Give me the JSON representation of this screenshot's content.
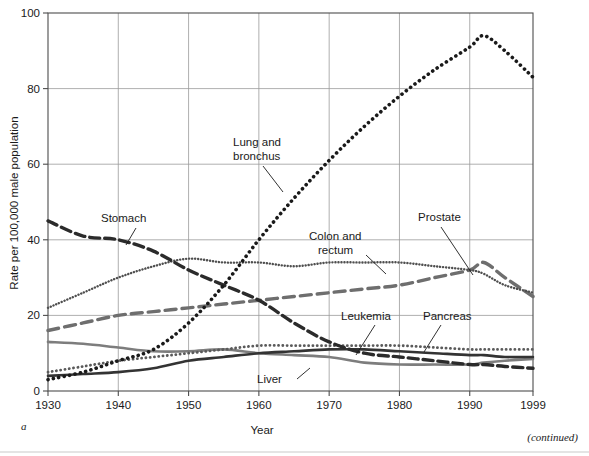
{
  "figure": {
    "panel_letter": "a",
    "continued_note": "(continued)"
  },
  "axes": {
    "ylabel": "Rate per 100,000 male population",
    "xlabel": "Year",
    "y_ticks": [
      "0",
      "20",
      "40",
      "60",
      "80",
      "100"
    ],
    "x_ticks": [
      "1930",
      "1940",
      "1950",
      "1960",
      "1970",
      "1980",
      "1990",
      "1999"
    ]
  },
  "labels": {
    "lung": "Lung and\nbronchus",
    "lung_line1": "Lung and",
    "lung_line2": "bronchus",
    "stomach": "Stomach",
    "colon_line1": "Colon and",
    "colon_line2": "rectum",
    "prostate": "Prostate",
    "leukemia": "Leukemia",
    "pancreas": "Pancreas",
    "liver": "Liver"
  },
  "colors": {
    "stomach": "#2b2b2b",
    "lung": "#1a1a1a",
    "colon": "#4f4f4f",
    "prostate": "#6e6e6e",
    "pancreas": "#5a5a5a",
    "leukemia": "#333333",
    "liver": "#7d7d7d",
    "grid": "#9a9a9a",
    "frame": "#4d4d4d"
  },
  "chart_data": {
    "type": "line",
    "title": "",
    "xlabel": "Year",
    "ylabel": "Rate per 100,000 male population",
    "xlim": [
      1930,
      1999
    ],
    "ylim": [
      0,
      100
    ],
    "grid": true,
    "legend": "inline-annotations",
    "x": [
      1930,
      1935,
      1940,
      1945,
      1950,
      1955,
      1960,
      1965,
      1970,
      1975,
      1980,
      1985,
      1990,
      1992,
      1995,
      1999
    ],
    "series": [
      {
        "name": "Lung and bronchus",
        "style": "dotted-heavy",
        "values": [
          3,
          5,
          8,
          11,
          18,
          28,
          40,
          51,
          61,
          70,
          78,
          85,
          91,
          94,
          90,
          83
        ]
      },
      {
        "name": "Stomach",
        "style": "dashed-heavy",
        "values": [
          45,
          41,
          40,
          37,
          32,
          28,
          24,
          18,
          13,
          10,
          9,
          8,
          7,
          7,
          6.5,
          6
        ]
      },
      {
        "name": "Colon and rectum",
        "style": "dotted-fine",
        "values": [
          22,
          26,
          30,
          33,
          35,
          34,
          34,
          33,
          34,
          34,
          34,
          33,
          32,
          31,
          28,
          26
        ]
      },
      {
        "name": "Prostate",
        "style": "dashed-gray",
        "values": [
          16,
          18,
          20,
          21,
          22,
          23,
          24,
          25,
          26,
          27,
          28,
          30,
          32,
          34,
          30,
          25
        ]
      },
      {
        "name": "Pancreas",
        "style": "dotted-medium",
        "values": [
          5,
          6.5,
          8,
          9,
          10,
          11,
          12,
          12,
          12,
          12,
          12,
          11.5,
          11,
          11,
          11,
          11
        ]
      },
      {
        "name": "Leukemia",
        "style": "solid-dark",
        "values": [
          4,
          4.5,
          5,
          6,
          8,
          9,
          10,
          10.5,
          11,
          11,
          10.5,
          10,
          9.5,
          9.5,
          9,
          9
        ]
      },
      {
        "name": "Liver",
        "style": "solid-gray",
        "values": [
          13,
          12.5,
          11.5,
          10.5,
          10.5,
          11,
          10,
          9.5,
          9,
          7.5,
          7,
          7,
          7,
          7.5,
          8,
          8.5
        ]
      }
    ]
  }
}
